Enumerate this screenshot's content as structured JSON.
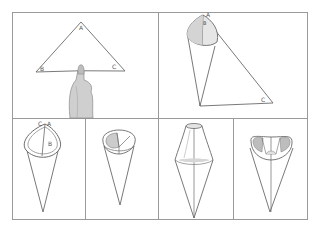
{
  "figure": {
    "colors": {
      "frame": "#9a9a9a",
      "line": "#6a6a6a",
      "shade": "#c8c8c8",
      "skin": "#bdbdbd",
      "background": "#ffffff"
    },
    "panels": [
      {
        "id": 1,
        "labels": {
          "A": "A",
          "B": "B",
          "C": "C"
        },
        "content": "triangle balanced on fingertip"
      },
      {
        "id": 2,
        "labels": {
          "A": "A",
          "B": "B",
          "C": "C"
        },
        "content": "triangle rolled into cone with tail C"
      },
      {
        "id": 3,
        "labels": {
          "A": "A",
          "B": "B",
          "C": "C"
        },
        "content": "completed cone with labels"
      },
      {
        "id": 4,
        "labels": {},
        "content": "cone with top folded in"
      },
      {
        "id": 5,
        "labels": {},
        "content": "cone pinched at top"
      },
      {
        "id": 6,
        "labels": {},
        "content": "cone with rim folded inward"
      }
    ]
  }
}
